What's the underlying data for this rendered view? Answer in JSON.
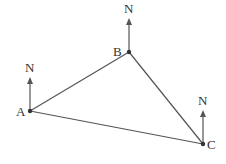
{
  "diagram": {
    "type": "bearing-triangle",
    "colors": {
      "line": "#4a4a4a",
      "point": "#333333",
      "text": "#333333"
    },
    "points": [
      {
        "id": "A",
        "label": "A",
        "x": 30,
        "y": 111,
        "north_label": "N"
      },
      {
        "id": "B",
        "label": "B",
        "x": 129,
        "y": 52,
        "north_label": "N"
      },
      {
        "id": "C",
        "label": "C",
        "x": 203,
        "y": 144,
        "north_label": "N"
      }
    ],
    "edges": [
      [
        "A",
        "B"
      ],
      [
        "B",
        "C"
      ],
      [
        "A",
        "C"
      ]
    ]
  }
}
